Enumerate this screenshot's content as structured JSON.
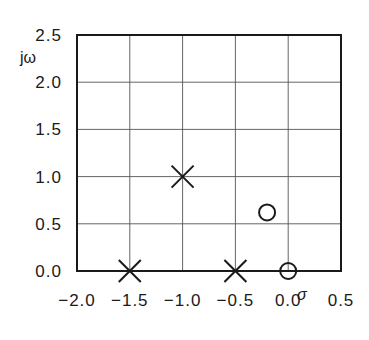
{
  "chart_data": {
    "type": "scatter",
    "title": "",
    "xlabel": "σ",
    "ylabel": "jω",
    "xlim": [
      -2.0,
      0.5
    ],
    "ylim": [
      0.0,
      2.5
    ],
    "grid": true,
    "xticks": [
      "−2.0",
      "−1.5",
      "−1.0",
      "−0.5",
      "0.0",
      "0.5"
    ],
    "yticks": [
      "0.0",
      "0.5",
      "1.0",
      "1.5",
      "2.0",
      "2.5"
    ],
    "series": [
      {
        "name": "poles",
        "marker": "x",
        "points": [
          [
            -1.5,
            0.0
          ],
          [
            -1.0,
            1.0
          ],
          [
            -0.5,
            0.0
          ]
        ]
      },
      {
        "name": "zeros",
        "marker": "o",
        "points": [
          [
            -0.2,
            0.62
          ],
          [
            0.0,
            0.0
          ]
        ]
      }
    ]
  },
  "colors": {
    "ink": "#1a1a1a",
    "grid": "#555555",
    "background": "#ffffff"
  }
}
